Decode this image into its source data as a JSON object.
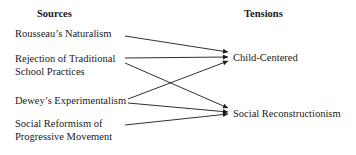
{
  "headers": {
    "sources": "Sources",
    "tensions": "Tensions"
  },
  "sources": [
    {
      "id": "rousseau",
      "line1": "Rousseau’s Naturalism",
      "line2": ""
    },
    {
      "id": "rejection",
      "line1": "Rejection of Traditional",
      "line2": "School Practices"
    },
    {
      "id": "dewey",
      "line1": "Dewey’s Experimentalism",
      "line2": ""
    },
    {
      "id": "reformism",
      "line1": "Social Reformism of",
      "line2": "Progressive Movement"
    }
  ],
  "tensions": [
    {
      "id": "child",
      "label": "Child-Centered"
    },
    {
      "id": "recon",
      "label": "Social Reconstructionism"
    }
  ],
  "edges": [
    {
      "from": "rousseau",
      "to": "child",
      "x1": 125,
      "y1": 36,
      "x2": 228,
      "y2": 52
    },
    {
      "from": "rejection",
      "to": "child",
      "x1": 125,
      "y1": 58,
      "x2": 228,
      "y2": 57
    },
    {
      "from": "rejection",
      "to": "recon",
      "x1": 125,
      "y1": 63,
      "x2": 228,
      "y2": 108
    },
    {
      "from": "dewey",
      "to": "child",
      "x1": 128,
      "y1": 99,
      "x2": 228,
      "y2": 61
    },
    {
      "from": "dewey",
      "to": "recon",
      "x1": 128,
      "y1": 103,
      "x2": 228,
      "y2": 112
    },
    {
      "from": "reformism",
      "to": "recon",
      "x1": 125,
      "y1": 125,
      "x2": 228,
      "y2": 114
    }
  ],
  "colors": {
    "line": "#1a1a1a",
    "text": "#1a1a1a"
  }
}
